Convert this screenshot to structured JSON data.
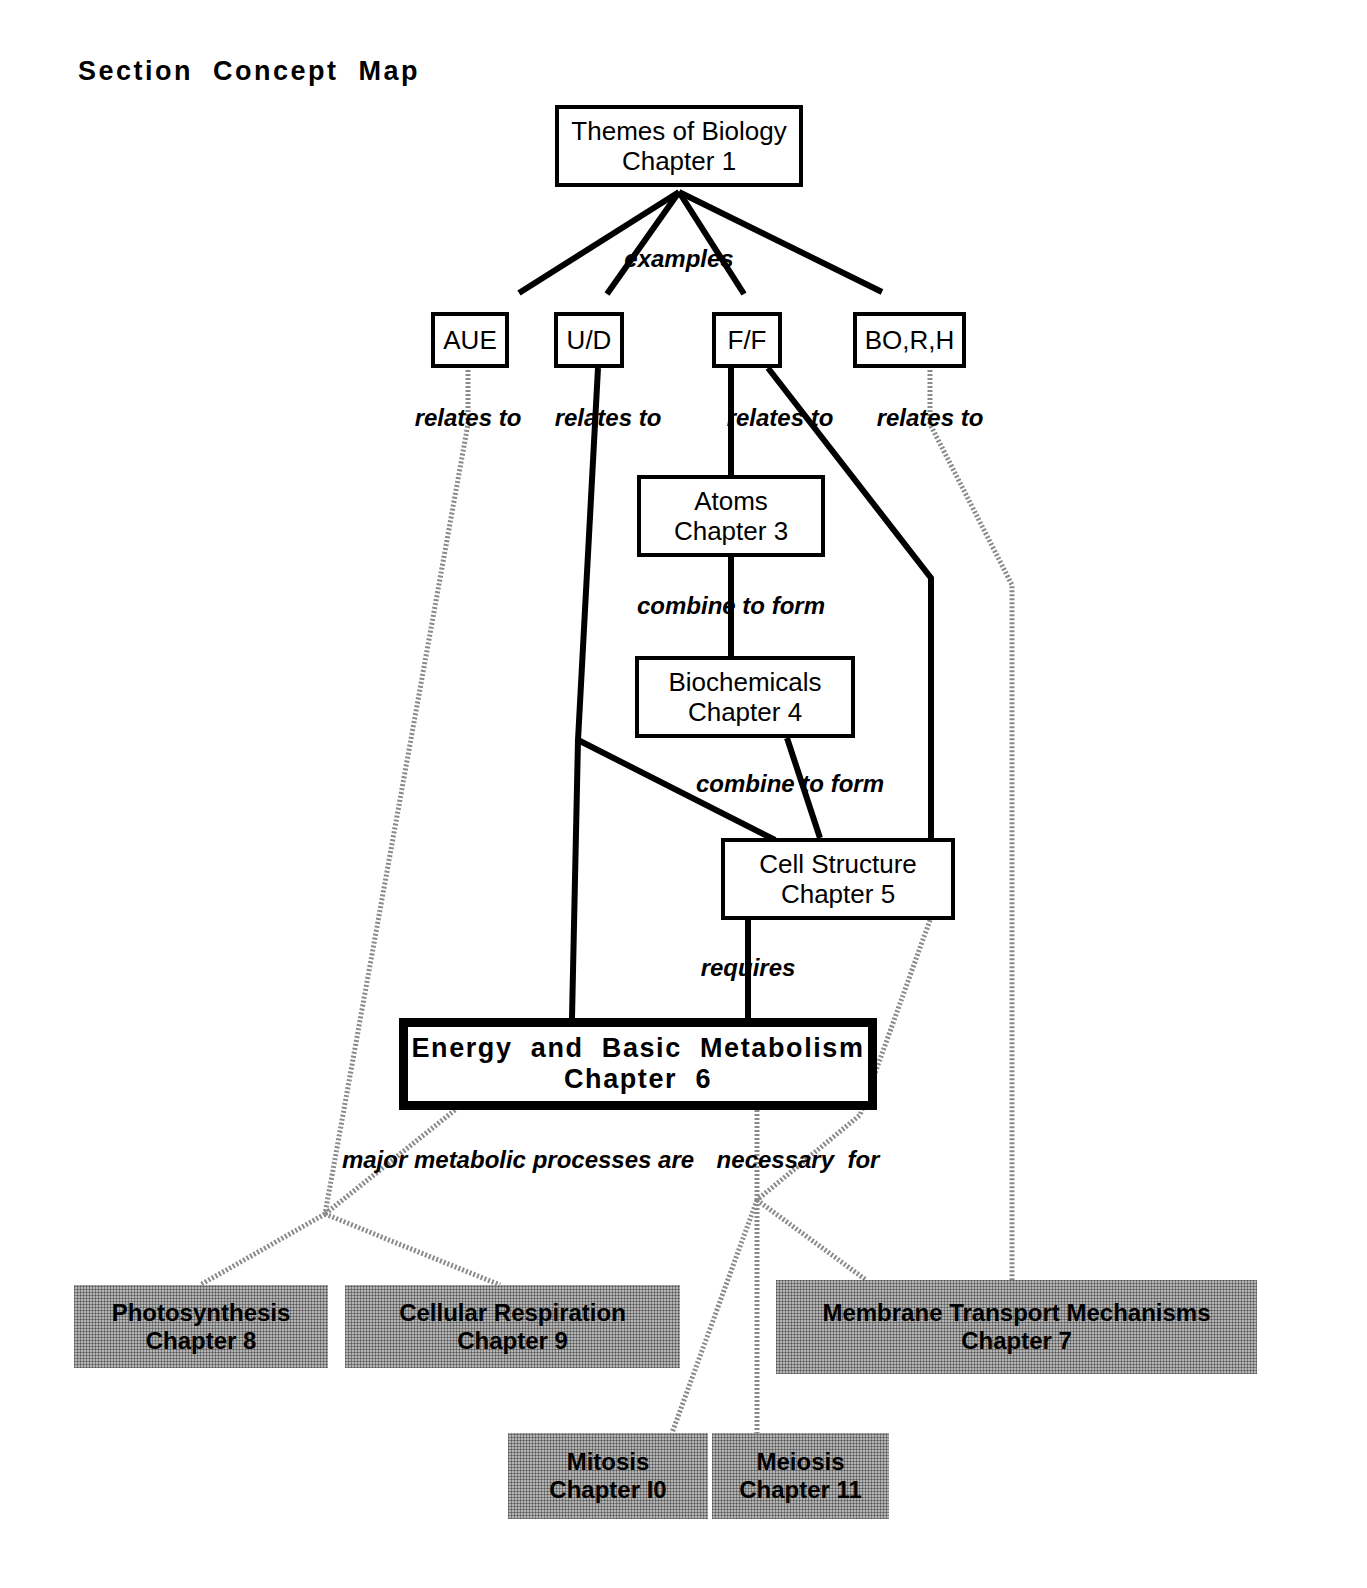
{
  "page": {
    "title": "Section  Concept  Map",
    "background_color": "#ffffff",
    "ink_color": "#000000",
    "shaded_node_color": "#b3b3b3"
  },
  "nodes": [
    {
      "id": "themes",
      "name": "themes-of-biology",
      "line1": "Themes of Biology",
      "line2": "Chapter 1",
      "style": "plain",
      "x": 555,
      "y": 105,
      "w": 248,
      "h": 82
    },
    {
      "id": "aue",
      "name": "aue",
      "line1": "AUE",
      "line2": "",
      "style": "small",
      "x": 431,
      "y": 312,
      "w": 78,
      "h": 56
    },
    {
      "id": "ud",
      "name": "u-d",
      "line1": "U/D",
      "line2": "",
      "style": "small",
      "x": 554,
      "y": 312,
      "w": 70,
      "h": 56
    },
    {
      "id": "ff",
      "name": "f-f",
      "line1": "F/F",
      "line2": "",
      "style": "small",
      "x": 712,
      "y": 312,
      "w": 70,
      "h": 56
    },
    {
      "id": "borh",
      "name": "bo-r-h",
      "line1": "BO,R,H",
      "line2": "",
      "style": "small",
      "x": 853,
      "y": 312,
      "w": 113,
      "h": 56
    },
    {
      "id": "atoms",
      "name": "atoms",
      "line1": "Atoms",
      "line2": "Chapter 3",
      "style": "plain",
      "x": 637,
      "y": 475,
      "w": 188,
      "h": 82
    },
    {
      "id": "biochemicals",
      "name": "biochemicals",
      "line1": "Biochemicals",
      "line2": "Chapter 4",
      "style": "plain",
      "x": 635,
      "y": 656,
      "w": 220,
      "h": 82
    },
    {
      "id": "cell",
      "name": "cell-structure",
      "line1": "Cell Structure",
      "line2": "Chapter 5",
      "style": "plain",
      "x": 721,
      "y": 838,
      "w": 234,
      "h": 82
    },
    {
      "id": "energy",
      "name": "energy-and-basic-metabolism",
      "line1": "Energy  and  Basic  Metabolism",
      "line2": "Chapter  6",
      "style": "emphasis",
      "x": 399,
      "y": 1018,
      "w": 478,
      "h": 92
    },
    {
      "id": "photosynthesis",
      "name": "photosynthesis",
      "line1": "Photosynthesis",
      "line2": "Chapter 8",
      "style": "shaded",
      "x": 74,
      "y": 1285,
      "w": 254,
      "h": 83
    },
    {
      "id": "respiration",
      "name": "cellular-respiration",
      "line1": "Cellular Respiration",
      "line2": "Chapter 9",
      "style": "shaded",
      "x": 345,
      "y": 1285,
      "w": 335,
      "h": 83
    },
    {
      "id": "membrane",
      "name": "membrane-transport-mechanisms",
      "line1": "Membrane Transport Mechanisms",
      "line2": "Chapter 7",
      "style": "shaded",
      "x": 776,
      "y": 1280,
      "w": 481,
      "h": 94
    },
    {
      "id": "mitosis",
      "name": "mitosis",
      "line1": "Mitosis",
      "line2": "Chapter I0",
      "style": "shaded",
      "x": 508,
      "y": 1433,
      "w": 200,
      "h": 86
    },
    {
      "id": "meiosis",
      "name": "meiosis",
      "line1": "Meiosis",
      "line2": "Chapter 11",
      "style": "shaded",
      "x": 712,
      "y": 1433,
      "w": 177,
      "h": 86
    }
  ],
  "edge_labels": [
    {
      "id": "examples",
      "name": "edge-label-examples",
      "text": "examples",
      "x": 679,
      "y": 245
    },
    {
      "id": "rel1",
      "name": "edge-label-relates-to-aue",
      "text": "relates to",
      "x": 468,
      "y": 404
    },
    {
      "id": "rel2",
      "name": "edge-label-relates-to-ud",
      "text": "relates to",
      "x": 608,
      "y": 404
    },
    {
      "id": "rel3",
      "name": "edge-label-relates-to-ff",
      "text": "relates to",
      "x": 780,
      "y": 404
    },
    {
      "id": "rel4",
      "name": "edge-label-relates-to-borh",
      "text": "relates to",
      "x": 930,
      "y": 404
    },
    {
      "id": "ctf1",
      "name": "edge-label-combine-to-form-1",
      "text": "combine to form",
      "x": 731,
      "y": 592
    },
    {
      "id": "ctf2",
      "name": "edge-label-combine-to-form-2",
      "text": "combine to form",
      "x": 790,
      "y": 770
    },
    {
      "id": "requires",
      "name": "edge-label-requires",
      "text": "requires",
      "x": 748,
      "y": 954
    },
    {
      "id": "major",
      "name": "edge-label-major-processes",
      "text": "major metabolic processes are",
      "x": 518,
      "y": 1146
    },
    {
      "id": "necessary",
      "name": "edge-label-necessary-for",
      "text": "necessary  for",
      "x": 798,
      "y": 1146
    }
  ],
  "connectors": {
    "solid": [
      {
        "name": "connector-themes-to-aue",
        "points": "679,192 519,293"
      },
      {
        "name": "connector-themes-to-ud",
        "points": "679,192 607,294"
      },
      {
        "name": "connector-themes-to-ff",
        "points": "679,192 744,294"
      },
      {
        "name": "connector-themes-to-borh",
        "points": "679,192 882,292"
      },
      {
        "name": "connector-ff-to-atoms",
        "points": "731,368 731,476"
      },
      {
        "name": "connector-atoms-to-biochem",
        "points": "731,557 731,657"
      },
      {
        "name": "connector-biochem-to-cell",
        "points": "787,738 820,838"
      },
      {
        "name": "connector-ud-down",
        "points": "598,368 578,740 572,1018"
      },
      {
        "name": "connector-ud-to-cell",
        "points": "578,740 775,840"
      },
      {
        "name": "connector-ff-to-cell-right",
        "points": "768,368 931,578 931,900 955,900"
      },
      {
        "name": "connector-cell-to-energy",
        "points": "748,920 748,1018"
      }
    ],
    "dotted": [
      {
        "name": "connector-aue-to-branch",
        "points": "468,370 468,424 325,1214"
      },
      {
        "name": "connector-branch-to-photo",
        "points": "325,1214 200,1285"
      },
      {
        "name": "connector-branch-to-resp",
        "points": "325,1214 500,1285"
      },
      {
        "name": "connector-energy-to-branch",
        "points": "455,1110 325,1214"
      },
      {
        "name": "connector-borh-to-membrane",
        "points": "930,370 930,424 1012,585 1012,1280"
      },
      {
        "name": "connector-cell-to-membrane",
        "points": "930,920 860,1115 757,1200"
      },
      {
        "name": "connector-energy-to-necfor",
        "points": "757,1110 757,1200"
      },
      {
        "name": "connector-necfor-to-mitosis",
        "points": "757,1200 672,1433"
      },
      {
        "name": "connector-necfor-to-meiosis",
        "points": "757,1200 757,1433"
      },
      {
        "name": "connector-necfor-to-membrane",
        "points": "757,1200 866,1280"
      }
    ]
  }
}
